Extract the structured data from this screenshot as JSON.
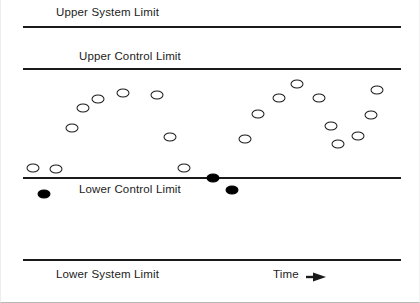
{
  "figure": {
    "title": "",
    "width": 420,
    "height": 303,
    "background": "#ffffff",
    "ink_color": "#1a1a1a"
  },
  "labels": {
    "upper_system_limit": "Upper System Limit",
    "upper_control_limit": "Upper Control Limit",
    "lower_control_limit": "Lower Control Limit",
    "lower_system_limit": "Lower System Limit",
    "time_axis": "Time",
    "time_arrow_icon": "arrow-right-icon"
  },
  "chart_data": {
    "type": "scatter",
    "title": "",
    "xlabel": "Time",
    "ylabel": "",
    "grid": false,
    "legend_position": "none",
    "axis_ranges": {
      "x": [
        0,
        420
      ],
      "y": [
        303,
        0
      ]
    },
    "reference_lines": [
      {
        "name": "Upper System Limit",
        "y_px": 26,
        "label": "Upper System Limit",
        "style": "solid-thick",
        "color": "#1a1a1a"
      },
      {
        "name": "Upper Control Limit",
        "y_px": 68,
        "label": "Upper Control Limit",
        "style": "solid-thin",
        "color": "#1a1a1a"
      },
      {
        "name": "Lower Control Limit",
        "y_px": 177,
        "label": "Lower Control Limit",
        "style": "solid-thin",
        "color": "#1a1a1a"
      },
      {
        "name": "Lower System Limit",
        "y_px": 259,
        "label": "Lower System Limit",
        "style": "solid-thick",
        "color": "#1a1a1a"
      }
    ],
    "series": [
      {
        "name": "In control (open markers)",
        "marker": "open-ellipse",
        "color": "#1a1a1a",
        "fill": "#ffffff",
        "points": [
          {
            "x": 32,
            "y": 168
          },
          {
            "x": 55,
            "y": 169
          },
          {
            "x": 71,
            "y": 128
          },
          {
            "x": 82,
            "y": 108
          },
          {
            "x": 97,
            "y": 99
          },
          {
            "x": 122,
            "y": 93
          },
          {
            "x": 156,
            "y": 95
          },
          {
            "x": 169,
            "y": 137
          },
          {
            "x": 183,
            "y": 168
          },
          {
            "x": 244,
            "y": 139
          },
          {
            "x": 257,
            "y": 114
          },
          {
            "x": 278,
            "y": 98
          },
          {
            "x": 296,
            "y": 84
          },
          {
            "x": 318,
            "y": 98
          },
          {
            "x": 330,
            "y": 126
          },
          {
            "x": 337,
            "y": 144
          },
          {
            "x": 357,
            "y": 136
          },
          {
            "x": 370,
            "y": 115
          },
          {
            "x": 376,
            "y": 90
          }
        ]
      },
      {
        "name": "Out of control (filled markers)",
        "marker": "filled-ellipse",
        "color": "#000000",
        "fill": "#000000",
        "points": [
          {
            "x": 43,
            "y": 194
          },
          {
            "x": 212,
            "y": 178
          },
          {
            "x": 231,
            "y": 190
          }
        ]
      }
    ],
    "annotations": [
      {
        "text": "Time",
        "x": 272,
        "y": 269,
        "arrow": "right"
      }
    ]
  }
}
